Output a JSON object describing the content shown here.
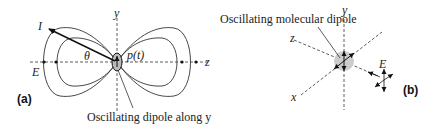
{
  "panel_a": {
    "label": "(a)",
    "axis_y": "y",
    "axis_z": "z",
    "intensity_label": "I",
    "angle_label": "θ",
    "dipole_label": "p(t)",
    "field_label": "E",
    "caption": "Oscillating dipole along y"
  },
  "panel_b": {
    "label": "(b)",
    "axis_y": "y",
    "axis_z": "z",
    "axis_x": "x",
    "field_label": "E",
    "caption": "Oscillating molecular dipole"
  }
}
